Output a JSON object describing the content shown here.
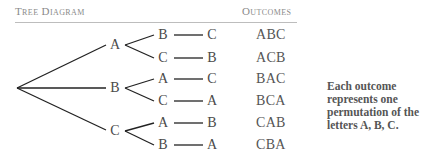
{
  "headers": {
    "tree": "Tree Diagram",
    "outcomes": "Outcomes"
  },
  "tree": {
    "root": "",
    "level1": [
      "A",
      "B",
      "C"
    ],
    "level2": [
      "B",
      "C",
      "A",
      "C",
      "A",
      "B"
    ],
    "level3": [
      "C",
      "B",
      "C",
      "A",
      "B",
      "A"
    ]
  },
  "outcomes": [
    "ABC",
    "ACB",
    "BAC",
    "BCA",
    "CAB",
    "CBA"
  ],
  "note": "Each outcome represents one permutation of the letters A, B, C."
}
